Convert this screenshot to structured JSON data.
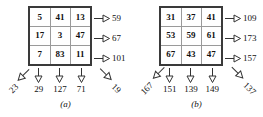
{
  "figure": {
    "panels": [
      {
        "caption": "(a)",
        "grid": [
          [
            "5",
            "41",
            "13"
          ],
          [
            "17",
            "3",
            "47"
          ],
          [
            "7",
            "83",
            "11"
          ]
        ],
        "row_sums": [
          "59",
          "67",
          "101"
        ],
        "column_sums": [
          "29",
          "127",
          "71"
        ],
        "diagonal_left_sum": "23",
        "diagonal_right_sum": "19"
      },
      {
        "caption": "(b)",
        "grid": [
          [
            "31",
            "37",
            "41"
          ],
          [
            "53",
            "59",
            "61"
          ],
          [
            "67",
            "43",
            "47"
          ]
        ],
        "row_sums": [
          "109",
          "173",
          "157"
        ],
        "column_sums": [
          "151",
          "139",
          "149"
        ],
        "diagonal_left_sum": "167",
        "diagonal_right_sum": "137"
      }
    ],
    "icons": {
      "row_arrow": "arrow-right-icon",
      "column_arrow": "arrow-down-icon",
      "diagonal_arrow": "arrow-diagonal-icon"
    },
    "colors": {
      "grid_border": "#3a3a3a",
      "cell_divider": "#9a9a9a",
      "text": "#111111",
      "background": "#ffffff"
    }
  }
}
